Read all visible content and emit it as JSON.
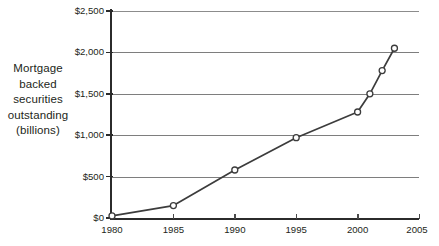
{
  "chart_data": {
    "type": "line",
    "title": "",
    "subtitle": "",
    "xlabel": "",
    "ylabel": "Mortgage backed securities outstanding (billions)",
    "ylabel_lines": [
      "Mortgage",
      "backed",
      "securities",
      "outstanding",
      "(billions)"
    ],
    "x": [
      1980,
      1985,
      1990,
      1995,
      2000,
      2001,
      2002,
      2003
    ],
    "values": [
      25,
      150,
      580,
      970,
      1280,
      1500,
      1780,
      2050
    ],
    "series": [
      {
        "name": "Mortgage backed securities outstanding",
        "x": [
          1980,
          1985,
          1990,
          1995,
          2000,
          2001,
          2002,
          2003
        ],
        "values": [
          25,
          150,
          580,
          970,
          1280,
          1500,
          1780,
          2050
        ]
      }
    ],
    "xlim": [
      1980,
      2005
    ],
    "ylim": [
      0,
      2500
    ],
    "x_ticks": [
      1980,
      1985,
      1990,
      1995,
      2000,
      2005
    ],
    "x_tick_labels": [
      "1980",
      "1985",
      "1990",
      "1995",
      "2000",
      "2005"
    ],
    "y_ticks": [
      0,
      500,
      1000,
      1500,
      2000,
      2500
    ],
    "y_tick_labels": [
      "$0",
      "$500",
      "$1,000",
      "$1,500",
      "$2,000",
      "$2,500"
    ],
    "grid": true,
    "grid_axis": "y",
    "legend": false,
    "legend_position": "none",
    "marker": "open-circle",
    "line_color": "#3c3c3c",
    "marker_fill": "#ffffff",
    "marker_stroke": "#3c3c3c",
    "grid_color": "#7e7e7e",
    "axis_color": "#2b2b2b",
    "background_color": "#ffffff",
    "annotations": []
  },
  "caption": {
    "sliver_text": ""
  }
}
